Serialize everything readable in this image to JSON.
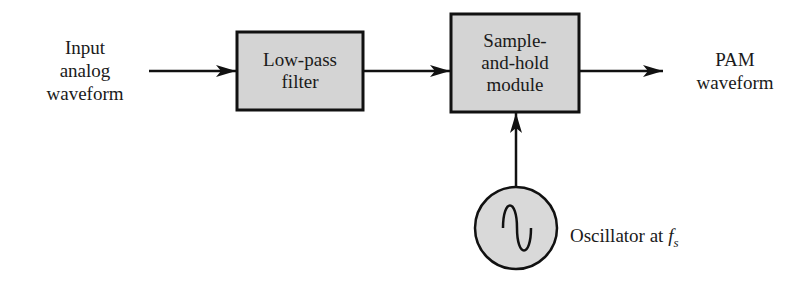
{
  "diagram": {
    "input_label": [
      "Input",
      "analog",
      "waveform"
    ],
    "blocks": [
      {
        "id": "low-pass-filter",
        "lines": [
          "Low-pass",
          "filter"
        ]
      },
      {
        "id": "sample-and-hold",
        "lines": [
          "Sample-",
          "and-hold",
          "module"
        ]
      }
    ],
    "output_label": [
      "PAM",
      "waveform"
    ],
    "oscillator": {
      "label_prefix": "Oscillator at ",
      "symbol": "f",
      "subscript": "s"
    },
    "colors": {
      "block_fill": "#d4d4d4",
      "stroke": "#111111",
      "circle_fill": "#d9d9d9"
    }
  }
}
